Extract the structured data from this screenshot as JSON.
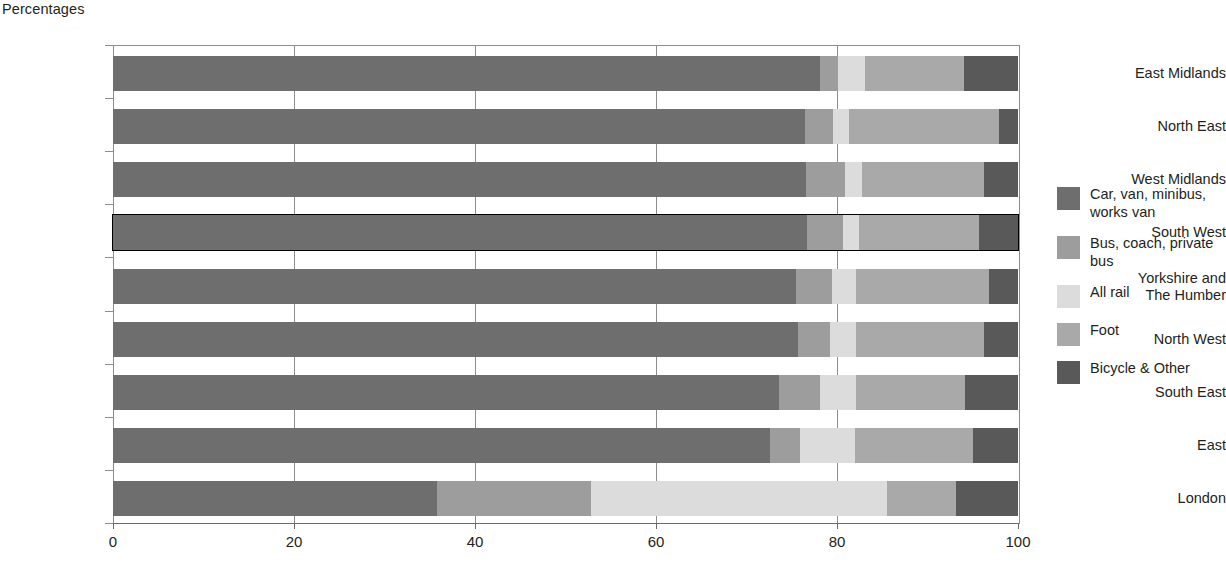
{
  "chart_data": {
    "type": "bar",
    "orientation": "horizontal",
    "stacked": true,
    "title": "Percentages",
    "xlabel": "",
    "ylabel": "",
    "xlim": [
      0,
      100
    ],
    "xticks": [
      0,
      20,
      40,
      60,
      80,
      100
    ],
    "grid": true,
    "legend_position": "right",
    "highlighted_category": "South West",
    "categories": [
      "East Midlands",
      "North East",
      "West Midlands",
      "South West",
      "Yorkshire and\nThe Humber",
      "North West",
      "South East",
      "East",
      "London"
    ],
    "series": [
      {
        "name": "Car, van, minibus, works van",
        "color": "#6e6e6e",
        "values": [
          78.1,
          76.5,
          76.6,
          76.7,
          75.5,
          75.7,
          73.6,
          72.6,
          35.8
        ]
      },
      {
        "name": "Bus, coach, private bus",
        "color": "#9d9d9d",
        "values": [
          2.0,
          3.1,
          4.3,
          4.0,
          4.0,
          3.5,
          4.5,
          3.3,
          17.0
        ]
      },
      {
        "name": "All rail",
        "color": "#dcdcdc",
        "values": [
          3.0,
          1.7,
          1.9,
          1.7,
          2.6,
          2.9,
          4.0,
          6.1,
          32.7
        ]
      },
      {
        "name": "Foot",
        "color": "#a9a9a9",
        "values": [
          10.9,
          16.6,
          13.5,
          13.3,
          14.7,
          14.1,
          12.1,
          13.0,
          7.7
        ]
      },
      {
        "name": "Bicycle & Other",
        "color": "#595959",
        "values": [
          6.0,
          2.1,
          3.7,
          4.3,
          3.2,
          3.8,
          5.8,
          5.0,
          6.8
        ]
      }
    ]
  },
  "legend": {
    "items": [
      {
        "label": "Car, van, minibus, works van",
        "color": "#6e6e6e"
      },
      {
        "label": "Bus, coach, private bus",
        "color": "#9d9d9d"
      },
      {
        "label": "All rail",
        "color": "#dcdcdc"
      },
      {
        "label": "Foot",
        "color": "#a9a9a9"
      },
      {
        "label": "Bicycle & Other",
        "color": "#595959"
      }
    ]
  },
  "axis": {
    "tick_labels": [
      "0",
      "20",
      "40",
      "60",
      "80",
      "100"
    ]
  }
}
